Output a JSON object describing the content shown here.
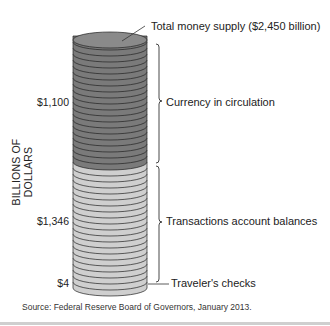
{
  "chart_data": {
    "type": "stacked-coin-column",
    "title": "Total money supply ($2,450 billion)",
    "ylabel": "BILLIONS OF DOLLARS",
    "units": "billions of dollars",
    "total": 2450,
    "components": [
      {
        "name": "Currency in circulation",
        "value": 1100,
        "value_label": "$1,100",
        "color": "#7a7a7a"
      },
      {
        "name": "Transactions account balances",
        "value": 1346,
        "value_label": "$1,346",
        "color": "#cfcfcf"
      },
      {
        "name": "Traveler's checks",
        "value": 4,
        "value_label": "$4",
        "color": "#cfcfcf"
      }
    ],
    "source": "Source: Federal Reserve Board of Governors, January 2013."
  },
  "labels": {
    "total": "Total money supply ($2,450 billion)",
    "currency": "Currency in circulation",
    "transactions": "Transactions account balances",
    "travelers": "Traveler's checks",
    "ylabel": "BILLIONS OF DOLLARS",
    "v_currency": "$1,100",
    "v_transactions": "$1,346",
    "v_travelers": "$4",
    "source": "Source: Federal Reserve Board of Governors, January 2013."
  }
}
